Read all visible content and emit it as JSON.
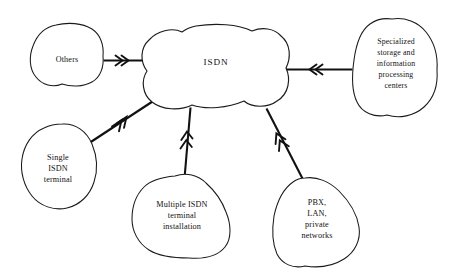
{
  "diagram": {
    "background_color": "#ffffff",
    "stroke_color": "#111111",
    "center": {
      "id": "isdn-cloud",
      "label": "ISDN",
      "shape": "cloud"
    },
    "nodes": [
      {
        "id": "others",
        "shape": "blob",
        "lines": [
          "Others"
        ],
        "position": "top-left"
      },
      {
        "id": "specialized-storage",
        "shape": "blob",
        "lines": [
          "Specialized",
          "storage and",
          "information",
          "processing",
          "centers"
        ],
        "position": "top-right"
      },
      {
        "id": "single-isdn-terminal",
        "shape": "blob",
        "lines": [
          "Single",
          "ISDN",
          "terminal"
        ],
        "position": "left"
      },
      {
        "id": "multiple-isdn-terminal",
        "shape": "blob",
        "lines": [
          "Multiple ISDN",
          "terminal",
          "installation"
        ],
        "position": "bottom-center"
      },
      {
        "id": "pbx-lan-private",
        "shape": "blob",
        "lines": [
          "PBX,",
          "LAN,",
          "private",
          "networks"
        ],
        "position": "bottom-right"
      }
    ],
    "connections": [
      {
        "id": "conn-others",
        "from": "others",
        "to": "isdn-cloud",
        "arrow": "double-chevron",
        "direction": "to-center"
      },
      {
        "id": "conn-specialized",
        "from": "specialized-storage",
        "to": "isdn-cloud",
        "arrow": "double-chevron",
        "direction": "to-center"
      },
      {
        "id": "conn-single-terminal",
        "from": "single-isdn-terminal",
        "to": "isdn-cloud",
        "arrow": "double-chevron",
        "direction": "to-center"
      },
      {
        "id": "conn-multiple-terminal",
        "from": "multiple-isdn-terminal",
        "to": "isdn-cloud",
        "arrow": "double-chevron",
        "direction": "to-center"
      },
      {
        "id": "conn-pbx",
        "from": "pbx-lan-private",
        "to": "isdn-cloud",
        "arrow": "double-chevron",
        "direction": "to-center"
      }
    ]
  }
}
